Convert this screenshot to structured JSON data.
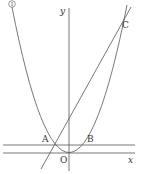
{
  "figure": {
    "curve_label": "①",
    "axis_labels": {
      "x": "x",
      "y": "y",
      "origin": "O"
    },
    "points": {
      "A": "A",
      "B": "B",
      "C": "C"
    },
    "colors": {
      "stroke": "#555555",
      "text": "#333333",
      "background": "#ffffff"
    }
  }
}
